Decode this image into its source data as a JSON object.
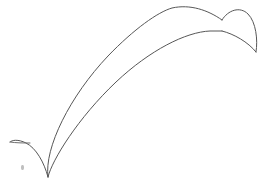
{
  "canvas": {
    "width": 266,
    "height": 189,
    "background_color": "#ffffff",
    "title": "Crescent arc line drawing"
  },
  "style": {
    "stroke_color": "#575757",
    "stroke_color_light": "#6d6d6d",
    "stroke_width": 1,
    "speck_color": "#8a8a8a"
  },
  "drawing": {
    "description": "Two long nearly parallel arcs forming a crescent band, each end closed by a small hooked cusp",
    "shapes": [
      {
        "name": "outer-arc",
        "label": "outer upper arc",
        "d": "M 48 177 C 44 148 70 96 108 56 C 134 29 158 12 172 8 C 190 4 208 10 222 20"
      },
      {
        "name": "inner-arc",
        "label": "inner lower arc",
        "d": "M 48 177 C 52 160 78 118 116 82 C 150 50 186 32 210 31 L 222 31"
      },
      {
        "name": "right-hook",
        "label": "right end hook cusp",
        "d": "M 222 20 C 228 10 240 6 248 14 C 256 22 258 40 256 52"
      },
      {
        "name": "right-hook-return",
        "label": "right end hook inner return",
        "d": "M 222 31 C 234 34 248 42 256 52"
      },
      {
        "name": "left-hook",
        "label": "left end hook cusp",
        "d": "M 48 177 C 44 162 36 148 26 143 C 18 139 12 140 10 142"
      },
      {
        "name": "left-hook-return",
        "label": "left end hook inner return",
        "d": "M 10 142 C 16 143 24 143 30 143"
      }
    ],
    "speck": {
      "name": "speck-mark",
      "label": "small faint mark",
      "x": 21,
      "y": 165
    }
  }
}
